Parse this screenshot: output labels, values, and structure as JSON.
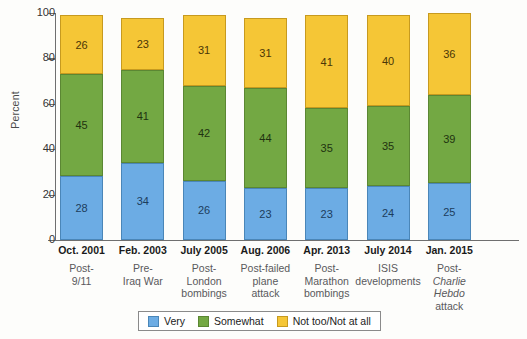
{
  "chart_data": {
    "type": "bar",
    "stacked": true,
    "title": "",
    "xlabel": "",
    "ylabel": "Percent",
    "ylim": [
      0,
      100
    ],
    "yticks": [
      0,
      20,
      40,
      60,
      80,
      100
    ],
    "grid": false,
    "legend_position": "bottom",
    "categories": [
      "Oct. 2001",
      "Feb. 2003",
      "July 2005",
      "Aug. 2006",
      "Apr. 2013",
      "July 2014",
      "Jan. 2015"
    ],
    "category_descriptions": [
      "Post-\n9/11",
      "Pre-\nIraq War",
      "Post-\nLondon\nbombings",
      "Post-failed\nplane\nattack",
      "Post-\nMarathon\nbombings",
      "ISIS\ndevelopments",
      "Post-\nCharlie Hebdo\nattack"
    ],
    "series": [
      {
        "name": "Very",
        "color": "#6cace4",
        "values": [
          28,
          34,
          26,
          23,
          23,
          24,
          25
        ]
      },
      {
        "name": "Somewhat",
        "color": "#73a843",
        "values": [
          45,
          41,
          42,
          44,
          35,
          35,
          39
        ]
      },
      {
        "name": "Not too/Not at all",
        "color": "#f5c636",
        "values": [
          26,
          23,
          31,
          31,
          41,
          40,
          36
        ]
      }
    ],
    "totals": [
      99,
      98,
      99,
      98,
      99,
      99,
      100
    ]
  },
  "axis": {
    "y_title": "Percent",
    "y_tick_labels": [
      "100",
      "80",
      "60",
      "40",
      "20",
      "0"
    ]
  },
  "categories": [
    {
      "date": "Oct. 2001",
      "desc_lines": [
        "Post-",
        "9/11"
      ],
      "very": "28",
      "somewhat": "45",
      "notat": "26"
    },
    {
      "date": "Feb. 2003",
      "desc_lines": [
        "Pre-",
        "Iraq War"
      ],
      "very": "34",
      "somewhat": "41",
      "notat": "23"
    },
    {
      "date": "July 2005",
      "desc_lines": [
        "Post-",
        "London",
        "bombings"
      ],
      "very": "26",
      "somewhat": "42",
      "notat": "31"
    },
    {
      "date": "Aug. 2006",
      "desc_lines": [
        "Post-failed",
        "plane",
        "attack"
      ],
      "very": "23",
      "somewhat": "44",
      "notat": "31"
    },
    {
      "date": "Apr. 2013",
      "desc_lines": [
        "Post-",
        "Marathon",
        "bombings"
      ],
      "very": "23",
      "somewhat": "35",
      "notat": "41"
    },
    {
      "date": "July 2014",
      "desc_lines": [
        "ISIS",
        "developments"
      ],
      "very": "24",
      "somewhat": "35",
      "notat": "40"
    },
    {
      "date": "Jan. 2015",
      "desc_lines": [
        "Post-",
        "Charlie",
        "Hebdo",
        "attack"
      ],
      "desc_italic_lines": [
        "Charlie",
        "Hebdo"
      ],
      "very": "25",
      "somewhat": "39",
      "notat": "36"
    }
  ],
  "legend": {
    "items": [
      {
        "label": "Very",
        "color": "#6cace4"
      },
      {
        "label": "Somewhat",
        "color": "#73a843"
      },
      {
        "label": "Not too/Not at all",
        "color": "#f5c636"
      }
    ]
  }
}
